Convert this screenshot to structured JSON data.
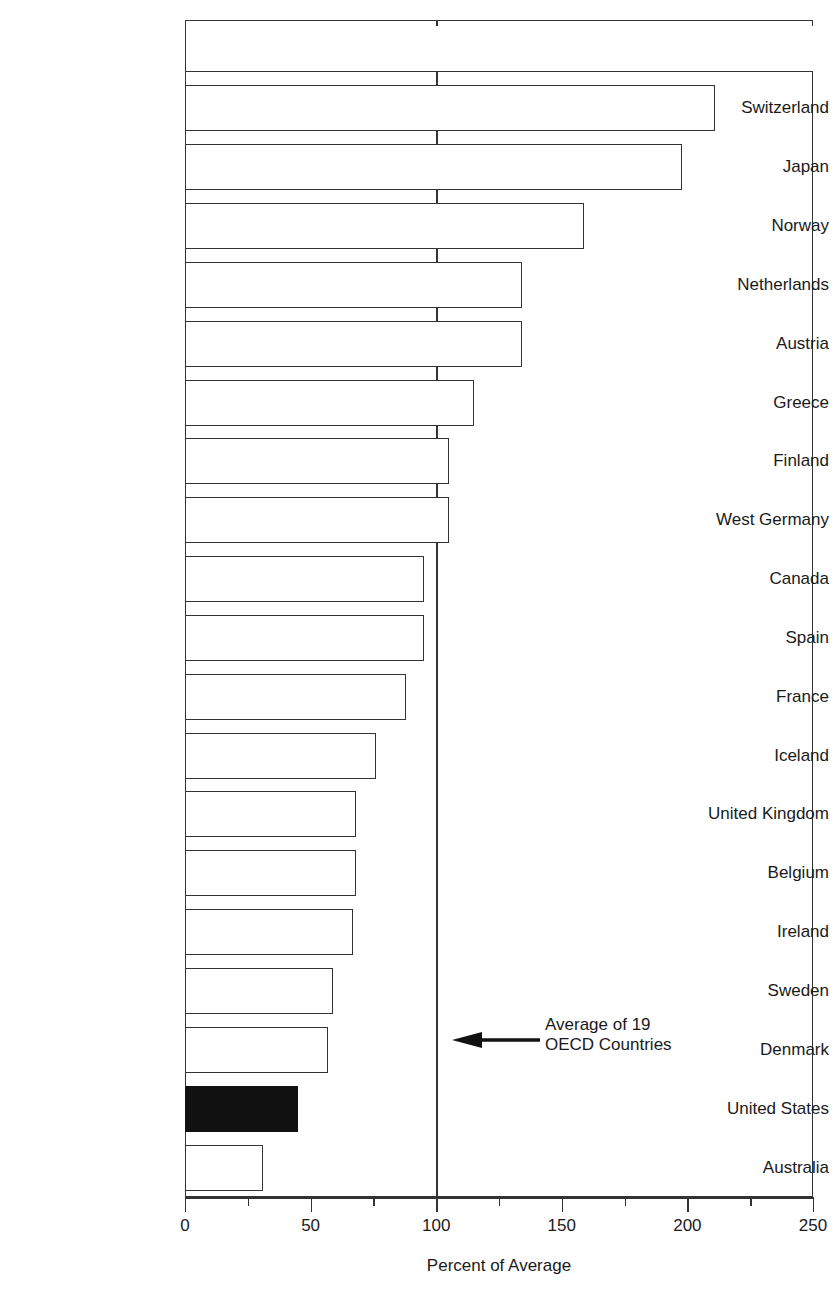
{
  "chart_data": {
    "type": "bar",
    "orientation": "horizontal",
    "title": "",
    "xlabel": "Percent of Average",
    "ylabel": "",
    "xlim": [
      0,
      250
    ],
    "ylim": null,
    "grid": false,
    "legend": null,
    "x_ticks_major": [
      "0",
      "50",
      "100",
      "150",
      "200",
      "250"
    ],
    "x_ticks_major_values": [
      0,
      50,
      100,
      150,
      200,
      250
    ],
    "x_ticks_minor_values": [
      25,
      75,
      125,
      175,
      225
    ],
    "reference_line": {
      "value": 100,
      "label": "Average of 19 OECD Countries"
    },
    "categories": [
      "",
      "Switzerland",
      "Japan",
      "Norway",
      "Netherlands",
      "Austria",
      "Greece",
      "Finland",
      "West Germany",
      "Canada",
      "Spain",
      "France",
      "Iceland",
      "United Kingdom",
      "Belgium",
      "Ireland",
      "Sweden",
      "Denmark",
      "United States",
      "Australia"
    ],
    "values": [
      250,
      211,
      198,
      159,
      134,
      134,
      115,
      105,
      105,
      95,
      95,
      88,
      76,
      68,
      68,
      67,
      59,
      57,
      45,
      31
    ],
    "highlighted_category": "United States",
    "highlight_color": "#111111",
    "bar_fill_color": "#ffffff",
    "bar_border_color": "#333333"
  },
  "annotation": {
    "line1": "Average of 19",
    "line2": "OECD Countries",
    "arrow_direction": "left"
  },
  "axis": {
    "x_title": "Percent of Average"
  },
  "title_fragment": ""
}
